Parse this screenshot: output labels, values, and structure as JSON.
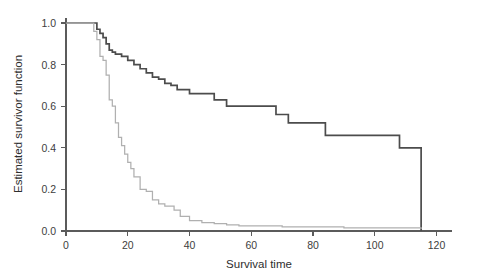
{
  "chart_data": {
    "type": "line",
    "title": "",
    "xlabel": "Survival time",
    "ylabel": "Estimated survivor function",
    "xlim": [
      0,
      120
    ],
    "ylim": [
      0,
      1.05
    ],
    "xticks": [
      0,
      20,
      40,
      60,
      80,
      100,
      120
    ],
    "xtick_labels": [
      "0",
      "20",
      "40",
      "60",
      "80",
      "100",
      "120"
    ],
    "yticks": [
      0.0,
      0.2,
      0.4,
      0.6,
      0.8,
      1.0
    ],
    "ytick_labels": [
      "0.0",
      "0.2",
      "0.4",
      "0.6",
      "0.8",
      "1.0"
    ],
    "grid": false,
    "legend": "none",
    "step_style": "post",
    "series": [
      {
        "name": "group-1-solid",
        "style": "solid",
        "color": "#4c4c4c",
        "x": [
          0,
          8,
          10,
          11,
          12,
          13,
          14,
          15,
          16,
          18,
          20,
          22,
          24,
          26,
          28,
          30,
          32,
          34,
          36,
          40,
          44,
          48,
          52,
          56,
          60,
          68,
          72,
          84,
          108,
          115
        ],
        "y": [
          1.0,
          1.0,
          0.97,
          0.95,
          0.93,
          0.9,
          0.87,
          0.86,
          0.85,
          0.84,
          0.82,
          0.8,
          0.78,
          0.76,
          0.74,
          0.73,
          0.71,
          0.7,
          0.68,
          0.66,
          0.66,
          0.63,
          0.6,
          0.6,
          0.6,
          0.56,
          0.52,
          0.46,
          0.4,
          0.0
        ]
      },
      {
        "name": "group-2-dotted",
        "style": "dotted",
        "color": "#b0b0b0",
        "x": [
          0,
          8,
          9,
          10,
          11,
          12,
          13,
          14,
          15,
          16,
          17,
          18,
          19,
          20,
          21,
          22,
          24,
          26,
          28,
          30,
          32,
          35,
          37,
          40,
          44,
          48,
          52,
          56,
          70,
          90,
          115
        ],
        "y": [
          1.0,
          1.0,
          0.96,
          0.92,
          0.84,
          0.82,
          0.75,
          0.63,
          0.6,
          0.52,
          0.45,
          0.41,
          0.37,
          0.33,
          0.3,
          0.26,
          0.2,
          0.19,
          0.15,
          0.13,
          0.12,
          0.1,
          0.07,
          0.05,
          0.04,
          0.035,
          0.03,
          0.025,
          0.02,
          0.015,
          0.01
        ]
      }
    ]
  },
  "axes": {
    "x_title": "Survival time",
    "y_title": "Estimated survivor function"
  }
}
